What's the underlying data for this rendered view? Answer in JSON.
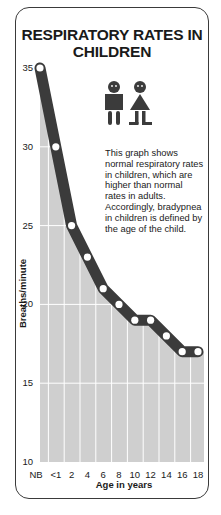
{
  "title": "RESPIRATORY RATES IN CHILDREN",
  "description": "This graph shows normal respiratory rates in children, which are higher than normal rates in adults. Accordingly, bradypnea in children is defined by the age of the child.",
  "icon": "children-boy-girl-icon",
  "colors": {
    "line": "#3b3b3b",
    "marker_fill": "#ffffff",
    "area_fill": "#cfcfcf",
    "gridline": "#ffffff",
    "border": "#3a3a3a",
    "text": "#1a1a1a"
  },
  "chart_data": {
    "type": "area",
    "title": "RESPIRATORY RATES IN CHILDREN",
    "xlabel": "Age in years",
    "ylabel": "Breaths/minute",
    "categories": [
      "NB",
      "<1",
      "2",
      "4",
      "6",
      "8",
      "10",
      "12",
      "14",
      "16",
      "18"
    ],
    "series": [
      {
        "name": "Normal respiratory rate",
        "values": [
          35,
          30,
          25,
          23,
          21,
          20,
          19,
          19,
          18,
          17,
          17
        ]
      }
    ],
    "yticks": [
      10,
      15,
      20,
      25,
      30,
      35
    ],
    "ylim": [
      10,
      35
    ],
    "grid": true,
    "legend": "none",
    "annotation": "This graph shows normal respiratory rates in children, which are higher than normal rates in adults. Accordingly, bradypnea in children is defined by the age of the child."
  }
}
